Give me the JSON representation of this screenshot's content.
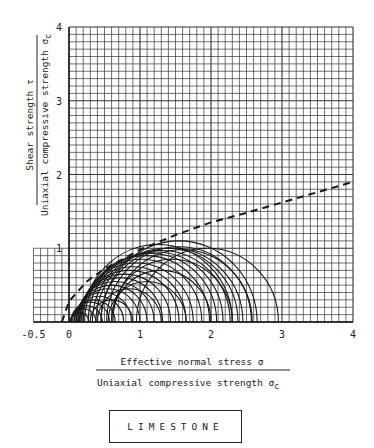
{
  "chart_data": {
    "type": "scatter",
    "subtype": "mohr-circles-with-envelope",
    "title": "LIMESTONE",
    "xlabel_numerator": "Effective normal stress σ",
    "xlabel_denominator": "Uniaxial compressive strength σc",
    "ylabel_numerator": "Shear strength τ",
    "ylabel_denominator": "Uniaxial compressive strength σc",
    "xlim": [
      -0.5,
      4
    ],
    "ylim": [
      0,
      4
    ],
    "x_ticks": [
      "-0.5",
      "0",
      "1",
      "2",
      "3",
      "4"
    ],
    "y_ticks": [
      "1",
      "2",
      "3",
      "4"
    ],
    "grid": true,
    "grid_minor_per_unit": 10,
    "legend_position": "bottom-center box",
    "envelope": {
      "style": "dashed",
      "x": [
        -0.1,
        0.0,
        0.25,
        0.5,
        1.0,
        1.5,
        2.0,
        2.5,
        3.0,
        3.5,
        4.0
      ],
      "y": [
        0.0,
        0.28,
        0.55,
        0.72,
        0.98,
        1.18,
        1.35,
        1.48,
        1.62,
        1.76,
        1.9
      ]
    },
    "circles": [
      {
        "c": 0.15,
        "r": 0.13
      },
      {
        "c": 0.2,
        "r": 0.18
      },
      {
        "c": 0.25,
        "r": 0.22
      },
      {
        "c": 0.3,
        "r": 0.27
      },
      {
        "c": 0.35,
        "r": 0.3
      },
      {
        "c": 0.42,
        "r": 0.35
      },
      {
        "c": 0.48,
        "r": 0.4
      },
      {
        "c": 0.55,
        "r": 0.45
      },
      {
        "c": 0.6,
        "r": 0.5
      },
      {
        "c": 0.65,
        "r": 0.55
      },
      {
        "c": 0.72,
        "r": 0.6
      },
      {
        "c": 0.78,
        "r": 0.65
      },
      {
        "c": 0.85,
        "r": 0.7
      },
      {
        "c": 0.9,
        "r": 0.75
      },
      {
        "c": 0.95,
        "r": 0.8
      },
      {
        "c": 1.02,
        "r": 0.85
      },
      {
        "c": 1.08,
        "r": 0.9
      },
      {
        "c": 1.15,
        "r": 0.93
      },
      {
        "c": 1.22,
        "r": 0.95
      },
      {
        "c": 1.3,
        "r": 0.97
      },
      {
        "c": 1.38,
        "r": 1.0
      },
      {
        "c": 1.45,
        "r": 1.0
      },
      {
        "c": 1.55,
        "r": 1.02
      },
      {
        "c": 1.6,
        "r": 0.98
      },
      {
        "c": 1.95,
        "r": 1.0
      },
      {
        "c": 0.85,
        "r": 0.45
      },
      {
        "c": 0.6,
        "r": 0.3
      },
      {
        "c": 1.1,
        "r": 0.55
      },
      {
        "c": 1.3,
        "r": 0.7
      },
      {
        "c": 1.45,
        "r": 0.85
      },
      {
        "c": 1.55,
        "r": 1.1
      },
      {
        "c": 1.25,
        "r": 1.05
      }
    ]
  },
  "ui": {
    "x_tick_labels": [
      "-0.5",
      "0",
      "1",
      "2",
      "3",
      "4"
    ],
    "y_tick_labels": [
      "1",
      "2",
      "3",
      "4"
    ],
    "xlabel_top": "Effective normal stress  σ",
    "xlabel_bottom": "Uniaxial compressive strength σ",
    "xlabel_sub": "c",
    "ylabel_top": "Shear strength  τ",
    "ylabel_bottom": "Uniaxial compressive strength σ",
    "ylabel_sub": "c",
    "legend": "LIMESTONE"
  },
  "colors": {
    "ink": "#1a1a1a",
    "grid": "#333333",
    "background": "#ffffff"
  }
}
